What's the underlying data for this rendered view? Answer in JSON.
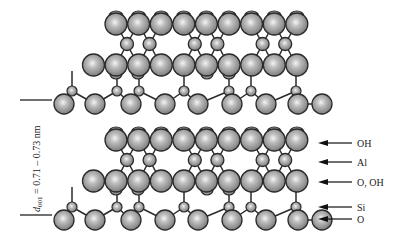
{
  "diagram": {
    "spacing_label": {
      "d": "d",
      "sub": "001",
      "rest": " = 0.71 – 0.73 nm"
    },
    "labels": [
      {
        "text": "OH",
        "y": 143
      },
      {
        "text": "Al",
        "y": 162
      },
      {
        "text": "O, OH",
        "y": 182
      },
      {
        "text": "Si",
        "y": 207
      },
      {
        "text": "O",
        "y": 219
      }
    ],
    "colors": {
      "sphere": "#9a9a9a",
      "highlight": "#f2f2f2",
      "outline": "#2a2a2a",
      "bond": "#2a2a2a"
    },
    "layers": [
      {
        "offset": 0
      },
      {
        "offset": 116
      }
    ]
  }
}
